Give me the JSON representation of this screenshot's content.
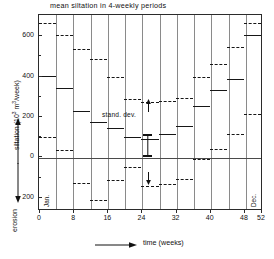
{
  "chart_data": {
    "type": "bar",
    "title": "mean siltation in 4-weekly periods",
    "xlabel": "time (weeks)",
    "ylabel_top": "siltation (10³ m³/week)",
    "ylabel_bottom": "erosion",
    "xlim": [
      0,
      52
    ],
    "ylim": [
      -260,
      700
    ],
    "xticks": [
      0,
      8,
      16,
      24,
      32,
      40,
      48,
      52
    ],
    "xtick_labels": [
      "0",
      "8",
      "16",
      "24",
      "32",
      "40",
      "48",
      "52"
    ],
    "yticks": [
      600,
      400,
      200,
      0,
      -200
    ],
    "ytick_labels": [
      "600",
      "400",
      "200",
      "0",
      "200"
    ],
    "grid": "vertical gridlines every 4 weeks",
    "legend": "none",
    "period_width_weeks": 4,
    "categories": [
      "0-4",
      "4-8",
      "8-12",
      "12-16",
      "16-20",
      "20-24",
      "24-28",
      "28-32",
      "32-36",
      "36-40",
      "40-44",
      "44-48",
      "48-52"
    ],
    "series": [
      {
        "name": "mean siltation",
        "style": "solid",
        "values": [
          400,
          340,
          225,
          170,
          140,
          95,
          85,
          112,
          150,
          250,
          330,
          385,
          600
        ]
      },
      {
        "name": "mean + standard deviation",
        "style": "dashed",
        "values": [
          660,
          600,
          530,
          480,
          395,
          285,
          270,
          275,
          290,
          395,
          460,
          540,
          660
        ]
      },
      {
        "name": "mean - standard deviation",
        "style": "dashed",
        "values": [
          95,
          30,
          -130,
          -215,
          -115,
          -50,
          -145,
          -135,
          -110,
          -15,
          35,
          110,
          210
        ]
      }
    ],
    "annotations": [
      {
        "text": "stand. dev.",
        "near_week": 26,
        "near_value": 215
      },
      {
        "text": "Jan.",
        "near_week": 1,
        "near_value": -215
      },
      {
        "text": "Dec.",
        "near_week": 49,
        "near_value": -215
      }
    ],
    "error_bar": {
      "label": "stand. dev.",
      "center_week": 25,
      "top_value": 150,
      "bottom_value": 50
    }
  },
  "axis": {
    "x_arrow_title": "time (weeks)",
    "y_up_label": "siltation (10",
    "y_up_label_tail": " m",
    "y_up_label_tail2": "/week)",
    "y_down_label": "erosion"
  }
}
